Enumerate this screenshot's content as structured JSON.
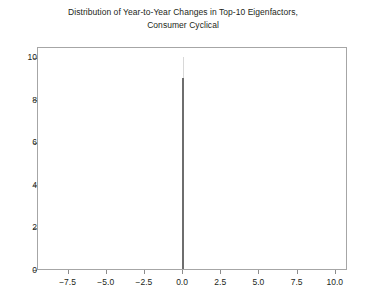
{
  "chart_data": {
    "type": "bar",
    "title": "Distribution of Year-to-Year Changes in Top-10 Eigenfactors, Consumer Cyclical",
    "title_lines": [
      "Distribution of Year-to-Year Changes in Top-10 Eigenfactors,",
      "Consumer Cyclical"
    ],
    "xlabel": "",
    "ylabel": "",
    "xlim": [
      -9.5,
      10.8
    ],
    "ylim": [
      0,
      10.5
    ],
    "grid": false,
    "legend": null,
    "xticks": [
      -7.5,
      -5.0,
      -2.5,
      0.0,
      2.5,
      5.0,
      7.5,
      10.0
    ],
    "xtick_labels": [
      "−7.5",
      "−5.0",
      "−2.5",
      "0.0",
      "2.5",
      "5.0",
      "7.5",
      "10.0"
    ],
    "yticks": [
      0,
      2,
      4,
      6,
      8,
      10
    ],
    "ytick_labels": [
      "0",
      "2",
      "4",
      "6",
      "8",
      "10"
    ],
    "bars": [
      {
        "x": 0.0,
        "value": 9.0,
        "width": 0.13,
        "color": "#6e6e6e"
      },
      {
        "x": 0.03,
        "value": 10.0,
        "width": 0.06,
        "color": "#d8d8d8"
      }
    ],
    "categories": [
      "0.0"
    ],
    "values": [
      9.0
    ],
    "colors": {
      "bar_primary": "#6e6e6e",
      "bar_secondary": "#d8d8d8",
      "axis": "#a6a6a6",
      "tick": "#8c8c8c",
      "text": "#231f20",
      "background": "#ffffff"
    }
  }
}
